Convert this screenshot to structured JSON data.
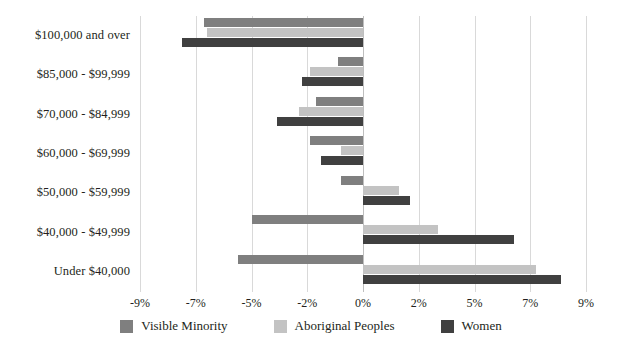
{
  "chart_data": {
    "type": "bar",
    "orientation": "horizontal",
    "title": "",
    "subtitle": "",
    "xlabel": "",
    "ylabel": "",
    "grid": true,
    "legend_position": "bottom",
    "xlim": [
      -9,
      9
    ],
    "xtick_labels": [
      "-9%",
      "-7%",
      "-5%",
      "-2%",
      "0%",
      "2%",
      "5%",
      "7%",
      "9%"
    ],
    "xtick_values": [
      -9,
      -7,
      -5,
      -2,
      0,
      2,
      5,
      7,
      9
    ],
    "categories": [
      "$100,000 and over",
      "$85,000 - $99,999",
      "$70,000 - $84,999",
      "$60,000 - $69,999",
      "$50,000 - $59,999",
      "$40,000 - $49,999",
      "Under $40,000"
    ],
    "series": [
      {
        "name": "Visible Minority",
        "color": "#7f7f7f",
        "values": [
          -5.7,
          -0.9,
          -1.7,
          -1.9,
          -0.8,
          -4.0,
          -4.5
        ]
      },
      {
        "name": "Aboriginal Peoples",
        "color": "#c3c3c3",
        "values": [
          -5.6,
          -1.9,
          -2.3,
          -0.8,
          1.3,
          2.7,
          6.2
        ]
      },
      {
        "name": "Women",
        "color": "#404040",
        "values": [
          -6.5,
          -2.2,
          -3.1,
          -1.5,
          1.7,
          5.4,
          7.1
        ]
      }
    ]
  },
  "legend": {
    "items": [
      {
        "label": "Visible Minority",
        "color": "#7f7f7f"
      },
      {
        "label": "Aboriginal Peoples",
        "color": "#c3c3c3"
      },
      {
        "label": "Women",
        "color": "#404040"
      }
    ]
  }
}
